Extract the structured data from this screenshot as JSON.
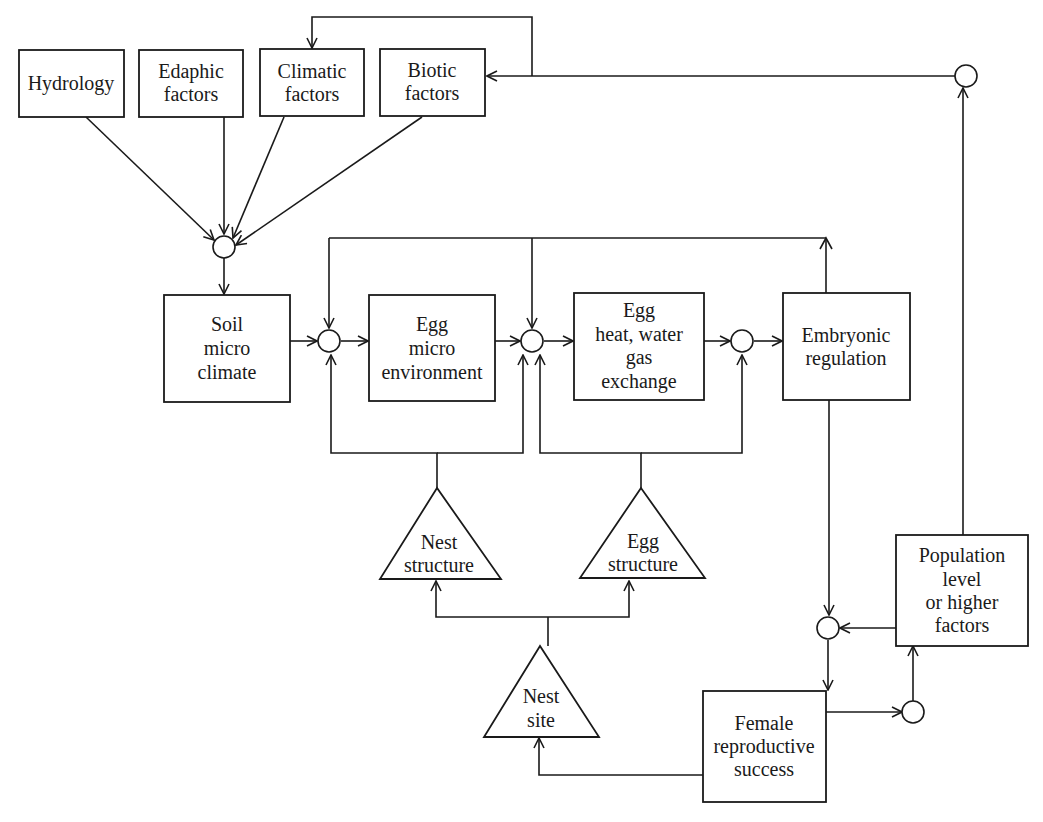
{
  "diagram": {
    "type": "ecological flow diagram",
    "boxes": {
      "hydrology": {
        "lines": [
          "Hydrology"
        ]
      },
      "edaphic": {
        "lines": [
          "Edaphic",
          "factors"
        ]
      },
      "climatic": {
        "lines": [
          "Climatic",
          "factors"
        ]
      },
      "biotic": {
        "lines": [
          "Biotic",
          "factors"
        ]
      },
      "soil": {
        "lines": [
          "Soil",
          "micro",
          "climate"
        ]
      },
      "egg_micro": {
        "lines": [
          "Egg",
          "micro",
          "environment"
        ]
      },
      "egg_heat": {
        "lines": [
          "Egg",
          "heat, water",
          "gas",
          "exchange"
        ]
      },
      "embryonic": {
        "lines": [
          "Embryonic",
          "regulation"
        ]
      },
      "population": {
        "lines": [
          "Population",
          "level",
          "or higher",
          "factors"
        ]
      },
      "female": {
        "lines": [
          "Female",
          "reproductive",
          "success"
        ]
      }
    },
    "triangles": {
      "nest_structure": {
        "lines": [
          "Nest",
          "structure"
        ]
      },
      "egg_structure": {
        "lines": [
          "Egg",
          "structure"
        ]
      },
      "nest_site": {
        "lines": [
          "Nest",
          "site"
        ]
      }
    },
    "colors": {
      "stroke": "#1a1a1a",
      "background": "#ffffff"
    }
  }
}
